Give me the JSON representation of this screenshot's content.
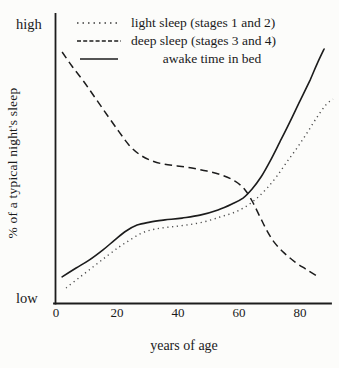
{
  "colors": {
    "ink": "#1c1c1c",
    "dotted_ink": "#4a4a4a",
    "paper": "#fcfcfa"
  },
  "chart_data": {
    "type": "line",
    "title": "",
    "xlabel": "years of age",
    "ylabel": "% of a typical night's sleep",
    "xlim": [
      0,
      92
    ],
    "ylim": [
      0,
      100
    ],
    "ylim_labels": {
      "low": "low",
      "high": "high"
    },
    "x_ticks": [
      0,
      20,
      40,
      60,
      80
    ],
    "grid": false,
    "legend_position": "top-inside",
    "series": [
      {
        "name": "light sleep (stages 1 and 2)",
        "key": "light-sleep-curve",
        "style": "dotted",
        "points": [
          [
            3.3,
            2.6
          ],
          [
            7.9,
            6.7
          ],
          [
            12.5,
            10.7
          ],
          [
            16.7,
            14.4
          ],
          [
            20.7,
            17.8
          ],
          [
            24.3,
            20.4
          ],
          [
            28.2,
            23
          ],
          [
            32.5,
            24.4
          ],
          [
            37.4,
            25.2
          ],
          [
            42.6,
            25.9
          ],
          [
            48.2,
            27
          ],
          [
            53.8,
            28.9
          ],
          [
            58.7,
            30.7
          ],
          [
            62.6,
            33
          ],
          [
            65.9,
            35.9
          ],
          [
            69.2,
            39.6
          ],
          [
            72.5,
            44.1
          ],
          [
            75.7,
            49.3
          ],
          [
            79,
            54.4
          ],
          [
            82.3,
            60
          ],
          [
            85.6,
            65.9
          ],
          [
            88.5,
            70.4
          ],
          [
            90.8,
            72.6
          ]
        ]
      },
      {
        "name": "deep sleep (stages 3 and 4)",
        "key": "deep-sleep-curve",
        "style": "dashed",
        "points": [
          [
            2,
            90
          ],
          [
            5.2,
            84.8
          ],
          [
            9.2,
            78.9
          ],
          [
            13.1,
            72.6
          ],
          [
            17,
            66.3
          ],
          [
            20.7,
            60.4
          ],
          [
            23.9,
            55.6
          ],
          [
            27.2,
            52.2
          ],
          [
            30.8,
            50
          ],
          [
            35.1,
            48.5
          ],
          [
            39.7,
            47.8
          ],
          [
            44.6,
            47
          ],
          [
            49.5,
            45.9
          ],
          [
            54.4,
            44.4
          ],
          [
            58.7,
            42.2
          ],
          [
            62,
            38.9
          ],
          [
            64.3,
            34.8
          ],
          [
            66.6,
            29.6
          ],
          [
            68.9,
            24.4
          ],
          [
            71.5,
            19.6
          ],
          [
            74.8,
            15.6
          ],
          [
            78.4,
            12.2
          ],
          [
            82.3,
            9.3
          ],
          [
            85.6,
            7
          ]
        ]
      },
      {
        "name": "awake time in bed",
        "key": "awake-time-curve",
        "style": "solid",
        "points": [
          [
            2,
            6.7
          ],
          [
            6.6,
            10
          ],
          [
            11,
            13
          ],
          [
            15.4,
            16.7
          ],
          [
            19.3,
            20.4
          ],
          [
            23,
            23.7
          ],
          [
            26.6,
            25.9
          ],
          [
            30.8,
            27
          ],
          [
            35.7,
            27.8
          ],
          [
            41.3,
            28.5
          ],
          [
            47.2,
            29.6
          ],
          [
            53.1,
            31.5
          ],
          [
            57.7,
            33.7
          ],
          [
            61.3,
            35.9
          ],
          [
            64.3,
            39.3
          ],
          [
            67.2,
            43.7
          ],
          [
            70.2,
            49.6
          ],
          [
            73.4,
            56.7
          ],
          [
            76.7,
            64.1
          ],
          [
            80,
            71.9
          ],
          [
            83.3,
            79.6
          ],
          [
            85.6,
            85.6
          ],
          [
            87.9,
            91.1
          ]
        ]
      }
    ]
  }
}
